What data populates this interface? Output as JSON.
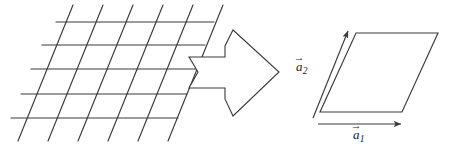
{
  "figure": {
    "background_color": "#ffffff",
    "line_color": "#3a3a3a",
    "label_color": "#1a1a1a"
  },
  "lattice": {
    "name": "oblique-lattice",
    "description": "Two-dimensional oblique lattice drawn as a mesh of horizontal lines crossed by slanted lines",
    "horizontal_line_count": 5,
    "slanted_line_count": 6,
    "horizontal_lines": [
      {
        "x1": 56,
        "y1": 22,
        "x2": 214,
        "y2": 22
      },
      {
        "x1": 42,
        "y1": 45,
        "x2": 205,
        "y2": 45
      },
      {
        "x1": 31,
        "y1": 69,
        "x2": 196,
        "y2": 69
      },
      {
        "x1": 21,
        "y1": 94,
        "x2": 187,
        "y2": 94
      },
      {
        "x1": 11,
        "y1": 118,
        "x2": 178,
        "y2": 118
      }
    ],
    "slanted_lines": [
      {
        "x1": 18,
        "y1": 141,
        "x2": 73,
        "y2": 5
      },
      {
        "x1": 48,
        "y1": 141,
        "x2": 103,
        "y2": 5
      },
      {
        "x1": 78,
        "y1": 141,
        "x2": 133,
        "y2": 5
      },
      {
        "x1": 108,
        "y1": 141,
        "x2": 163,
        "y2": 5
      },
      {
        "x1": 138,
        "y1": 141,
        "x2": 193,
        "y2": 5
      },
      {
        "x1": 168,
        "y1": 141,
        "x2": 223,
        "y2": 5
      }
    ]
  },
  "block_arrow": {
    "name": "transformation-arrow",
    "direction": "right",
    "style": "hollow outline block arrow with notched tail",
    "points": "225,57 225,46 233,30 279,72 233,116 225,99 225,88 189,88 198,72 189,57"
  },
  "unit_cell": {
    "name": "primitive-unit-cell",
    "shape": "parallelogram",
    "points": "320,112 402,112 438,33 356,33"
  },
  "vectors": [
    {
      "id": "a2",
      "name": "basis-vector-a2",
      "label_base": "a",
      "label_subscript": "2",
      "accent": "→",
      "x1": 313,
      "y1": 118,
      "x2": 348,
      "y2": 31
    },
    {
      "id": "a1",
      "name": "basis-vector-a1",
      "label_base": "a",
      "label_subscript": "1",
      "accent": "→",
      "x1": 318,
      "y1": 124,
      "x2": 401,
      "y2": 124
    }
  ]
}
